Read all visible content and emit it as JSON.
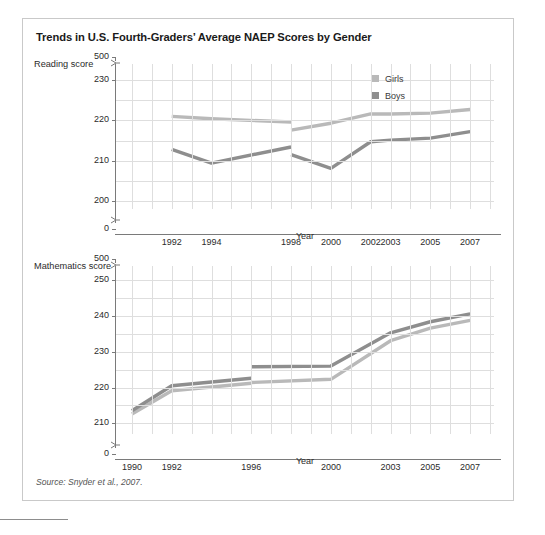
{
  "figure": {
    "title": "Trends in U.S. Fourth-Graders’ Average NAEP Scores by Gender",
    "source": "Source: Snyder et al., 2007."
  },
  "colors": {
    "girls": "#b9b9b9",
    "boys": "#8e8e8e",
    "grid": "#dedede",
    "axis": "#7a7a7a",
    "border": "#c9c9c9",
    "text": "#2b2b2b"
  },
  "legend": {
    "position": "top-right",
    "items": [
      {
        "label": "Girls",
        "color": "#b9b9b9",
        "swatch": "legend-swatch-girls"
      },
      {
        "label": "Boys",
        "color": "#8e8e8e",
        "swatch": "legend-swatch-boys"
      }
    ]
  },
  "chart_data": [
    {
      "type": "line",
      "id": "reading",
      "title": "",
      "ylabel": "Reading score",
      "xlabel": "Year",
      "grid": true,
      "axis_break": true,
      "ylim": [
        0,
        500
      ],
      "y_ticks": [
        "0",
        "200",
        "210",
        "220",
        "230",
        "500"
      ],
      "y_ticks_numeric": [
        0,
        200,
        210,
        220,
        230,
        500
      ],
      "y_plot_range": [
        198,
        234
      ],
      "x_ticks": [
        "1992",
        "1994",
        "1998",
        "2000",
        "2002",
        "2003",
        "2005",
        "2007"
      ],
      "x_ticks_numeric": [
        1992,
        1994,
        1998,
        2000,
        2002,
        2003,
        2005,
        2007
      ],
      "xlim": [
        1989.2,
        2008.2
      ],
      "series": [
        {
          "name": "Girls",
          "color": "#b9b9b9",
          "segments": [
            {
              "x": [
                1992,
                1994,
                1998
              ],
              "values": [
                221.0,
                220.4,
                219.6
              ]
            },
            {
              "x": [
                1998,
                2000,
                2002,
                2003,
                2005,
                2007
              ],
              "values": [
                217.6,
                219.3,
                221.6,
                221.6,
                221.8,
                222.7
              ]
            }
          ]
        },
        {
          "name": "Boys",
          "color": "#8e8e8e",
          "segments": [
            {
              "x": [
                1992,
                1994,
                1998
              ],
              "values": [
                212.8,
                209.4,
                213.4
              ]
            },
            {
              "x": [
                1998,
                2000,
                2002,
                2003,
                2005,
                2007
              ],
              "values": [
                211.5,
                208.1,
                214.7,
                215.1,
                215.6,
                217.2
              ]
            }
          ]
        }
      ]
    },
    {
      "type": "line",
      "id": "mathematics",
      "title": "",
      "ylabel": "Mathematics score",
      "xlabel": "Year",
      "grid": true,
      "axis_break": true,
      "ylim": [
        0,
        500
      ],
      "y_ticks": [
        "0",
        "210",
        "220",
        "230",
        "240",
        "250",
        "500"
      ],
      "y_ticks_numeric": [
        0,
        210,
        220,
        230,
        240,
        250,
        500
      ],
      "y_plot_range": [
        207,
        254
      ],
      "x_ticks": [
        "1990",
        "1992",
        "1996",
        "2000",
        "2003",
        "2005",
        "2007"
      ],
      "x_ticks_numeric": [
        1990,
        1992,
        1996,
        2000,
        2003,
        2005,
        2007
      ],
      "xlim": [
        1989.2,
        2008.2
      ],
      "series": [
        {
          "name": "Girls",
          "color": "#b9b9b9",
          "segments": [
            {
              "x": [
                1990,
                1992,
                1996
              ],
              "values": [
                212.6,
                219.1,
                221.2
              ]
            },
            {
              "x": [
                1996,
                2000,
                2003,
                2005,
                2007
              ],
              "values": [
                221.4,
                222.3,
                233.1,
                236.6,
                238.8
              ]
            }
          ]
        },
        {
          "name": "Boys",
          "color": "#8e8e8e",
          "segments": [
            {
              "x": [
                1990,
                1992,
                1996
              ],
              "values": [
                213.5,
                220.5,
                222.6
              ]
            },
            {
              "x": [
                1996,
                2000,
                2003,
                2005,
                2007
              ],
              "values": [
                225.8,
                226.0,
                235.3,
                238.4,
                240.6
              ]
            }
          ]
        }
      ]
    }
  ]
}
